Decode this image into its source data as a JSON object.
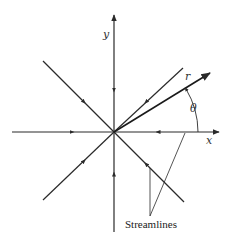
{
  "diagram": {
    "labels": {
      "y_axis": "y",
      "x_axis": "x",
      "radius": "r",
      "angle": "θ",
      "streamlines": "Streamlines"
    },
    "colors": {
      "line": "#2a2a2a",
      "background": "#ffffff"
    },
    "origin": [
      114,
      132
    ],
    "streamlines": [
      {
        "name": "top-vertical",
        "end": [
          114,
          14
        ],
        "flow": "inward"
      },
      {
        "name": "bottom-vertical",
        "end": [
          114,
          232
        ],
        "flow": "inward"
      },
      {
        "name": "left-horizontal",
        "end": [
          12,
          132
        ],
        "flow": "inward"
      },
      {
        "name": "right-horizontal",
        "end": [
          200,
          132
        ],
        "flow": "inward"
      },
      {
        "name": "upper-left-diagonal",
        "end": [
          43,
          61
        ],
        "flow": "inward"
      },
      {
        "name": "lower-right-diagonal",
        "end": [
          184,
          202
        ],
        "flow": "inward"
      },
      {
        "name": "lower-left-diagonal",
        "end": [
          43,
          200
        ],
        "flow": "inward"
      },
      {
        "name": "upper-right-diagonal",
        "end": [
          183,
          68
        ],
        "flow": "inward"
      }
    ],
    "radius_vector": {
      "end": [
        211,
        72
      ]
    }
  }
}
